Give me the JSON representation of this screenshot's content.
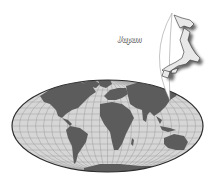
{
  "map": {
    "projection": "world-ellipse",
    "ocean_color": "#d6d6d6",
    "grid_color": "#9c9c9c",
    "land_color": "#5c5c5c",
    "outline_color": "#2e2e2e"
  },
  "callout": {
    "label": "Japan",
    "island_fill": "#e8e8e8",
    "island_stroke": "#333333",
    "shadow_color": "#555555"
  }
}
